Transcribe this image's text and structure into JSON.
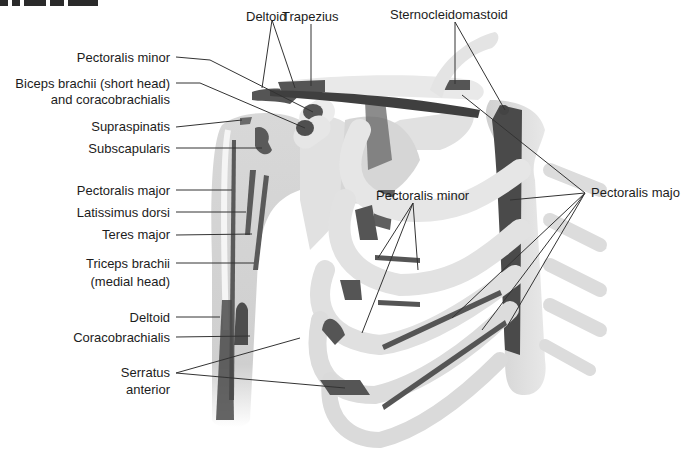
{
  "title_fragment": "(cut-off heading at top-left)",
  "colors": {
    "bone": "#ececec",
    "bone_shade": "#c9c9c9",
    "muscle_attachment": "#5a5a5a",
    "leader_line": "#333333",
    "text": "#1c1c1c",
    "background": "#ffffff"
  },
  "labels": {
    "deltoid_top": "Deltoid",
    "trapezius": "Trapezius",
    "sternocleidomastoid": "Sternocleidomastoid",
    "pectoralis_minor_top": "Pectoralis minor",
    "biceps_line1": "Biceps brachii (short head)",
    "biceps_line2": "and coracobrachialis",
    "supraspinatis": "Supraspinatis",
    "subscapularis": "Subscapularis",
    "pectoralis_major_left": "Pectoralis major",
    "latissimus_dorsi": "Latissimus dorsi",
    "teres_major": "Teres major",
    "triceps_line1": "Triceps brachii",
    "triceps_line2": "(medial head)",
    "deltoid_bottom": "Deltoid",
    "coracobrachialis": "Coracobrachialis",
    "serratus_line1": "Serratus",
    "serratus_line2": "anterior",
    "pectoralis_minor_center": "Pectoralis minor",
    "pectoralis_major_right": "Pectoralis majo"
  }
}
